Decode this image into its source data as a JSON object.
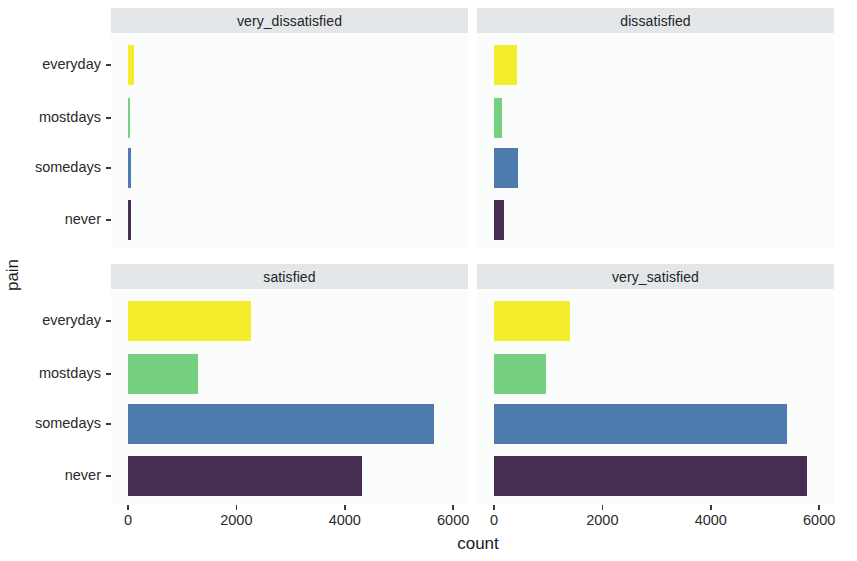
{
  "chart_data": {
    "type": "bar",
    "orientation": "horizontal",
    "title": "",
    "xlabel": "count",
    "ylabel": "pain",
    "xlim": [
      0,
      6200
    ],
    "grid": false,
    "legend": "none",
    "facet_variable": "satisfaction",
    "facet_layout": "2x2",
    "categories": [
      "everyday",
      "mostdays",
      "somedays",
      "never"
    ],
    "xticks": [
      0,
      2000,
      4000,
      6000
    ],
    "xtick_labels": [
      "0",
      "2000",
      "4000",
      "6000"
    ],
    "category_colors": {
      "everyday": "#f5ec2b",
      "mostdays": "#74cf80",
      "somedays": "#4f7cae",
      "never": "#452e51"
    },
    "panels": [
      {
        "label": "very_dissatisfied",
        "values": [
          110,
          35,
          62,
          55
        ]
      },
      {
        "label": "dissatisfied",
        "values": [
          430,
          140,
          445,
          180
        ]
      },
      {
        "label": "satisfied",
        "values": [
          2270,
          1290,
          5650,
          4310
        ]
      },
      {
        "label": "very_satisfied",
        "values": [
          1400,
          960,
          5410,
          5780
        ]
      }
    ]
  },
  "axes": {
    "y_title": "pain",
    "x_title": "count"
  }
}
